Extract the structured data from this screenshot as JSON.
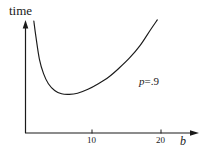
{
  "figure": {
    "width": 209,
    "height": 155,
    "background_color": "#ffffff",
    "ink_color": "#1a1a1a"
  },
  "labels": {
    "y_axis_title": "time",
    "x_axis_title": "b",
    "annotation_symbol": "p",
    "annotation_value": "=.9",
    "annotation_full": "p=.9"
  },
  "chart_data": {
    "type": "line",
    "title": "",
    "xlabel": "b",
    "ylabel": "time",
    "xlim": [
      0,
      24
    ],
    "ylim": [
      0,
      1
    ],
    "grid": false,
    "legend": null,
    "x_ticks": [
      10,
      20
    ],
    "x_tick_labels": [
      "10",
      "20"
    ],
    "y_ticks": [],
    "y_tick_labels": [],
    "axis_arrows": {
      "x": true,
      "y": true
    },
    "annotations": [
      {
        "text": "p=.9",
        "x": 17.5,
        "y": 0.46
      }
    ],
    "series": [
      {
        "name": "time(b) at p=.9",
        "x": [
          1.2,
          1.5,
          2.0,
          2.6,
          3.3,
          4.2,
          5.2,
          6.3,
          7.5,
          9.0,
          10.5,
          12.0,
          13.5,
          15.0,
          16.5,
          18.0,
          19.0
        ],
        "y": [
          1.0,
          0.86,
          0.66,
          0.53,
          0.44,
          0.38,
          0.35,
          0.345,
          0.355,
          0.39,
          0.44,
          0.5,
          0.58,
          0.67,
          0.78,
          0.92,
          1.01
        ]
      }
    ]
  }
}
